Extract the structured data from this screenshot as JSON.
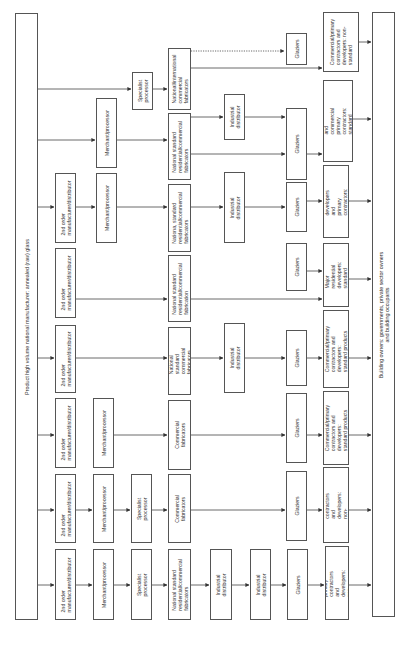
{
  "diagram": {
    "source": {
      "label": "Product high volume national manufacturer: annealed (raw) glass"
    },
    "sink": {
      "label": "Building owners: governments, private sector owners\nand building occupants"
    },
    "chains": [
      {
        "id": 1,
        "nodes": [
          "Specialist\nprocessor",
          "National/international\ncommercial\nfabricators",
          "Glaziers",
          "Commercial/primary\ncontractors and\ndevelopers: non-\nstandard"
        ],
        "notes": "Dotted link from fabricators to Glaziers; solid link from fabricators to contractors"
      },
      {
        "id": 2,
        "nodes": [
          "Merchant/processor",
          "National standard\nresidential/commercial\nfabricators",
          "Industrial\ndistributor",
          "Glaziers",
          "Residential developers and\ncommercial primary\ncontractors: standard and non-\nstandard"
        ]
      },
      {
        "id": 3,
        "nodes": [
          "2nd order\nmanufacturer/distributor",
          "Merchant/processor",
          "Nationa, standard\nresidential/commercial\nfabricators",
          "Industrial distributor",
          "Glaziers",
          "Residential developers\nand primary contractors:\nstandard"
        ]
      },
      {
        "id": 4,
        "nodes": [
          "2nd order\nmanufacturer/distributor",
          "National standard\nresidential/commercial\nfabrication",
          "Glaziers",
          "Major residential\ndevelopers: standard"
        ]
      },
      {
        "id": 5,
        "nodes": [
          "2nd order\nmanufacturer/distributor",
          "National standard\ncommercial fabricators",
          "Industrial distributor",
          "Glaziers",
          "Commercial/primary\ncontractors and developers:\nstandard products"
        ]
      },
      {
        "id": 6,
        "nodes": [
          "2nd order\nmanufacturer/distributor",
          "Merchant/processor",
          "Commercial fabricators",
          "Glaziers",
          "Commercial/primary\ncontractors and developers:\nstandard products"
        ]
      },
      {
        "id": 7,
        "nodes": [
          "2nd order\nmanufacturer/distributor",
          "Merchant/processor",
          "Specialist processor",
          "Commercial fabricators",
          "Glaziers",
          "Commercial primary\ncontractors and developers:\nnon-standard products"
        ]
      },
      {
        "id": 8,
        "nodes": [
          "2nd order\nmanufacturer/distributor",
          "Merchant/processor",
          "Specialist processor",
          "National standard\nresidential/commercial\nfabricators",
          "Industrial distributor",
          "Industrial distributor",
          "Glaziers",
          "Commercial\nprimary contractors and\ndevelopers: non-standard"
        ]
      }
    ]
  }
}
